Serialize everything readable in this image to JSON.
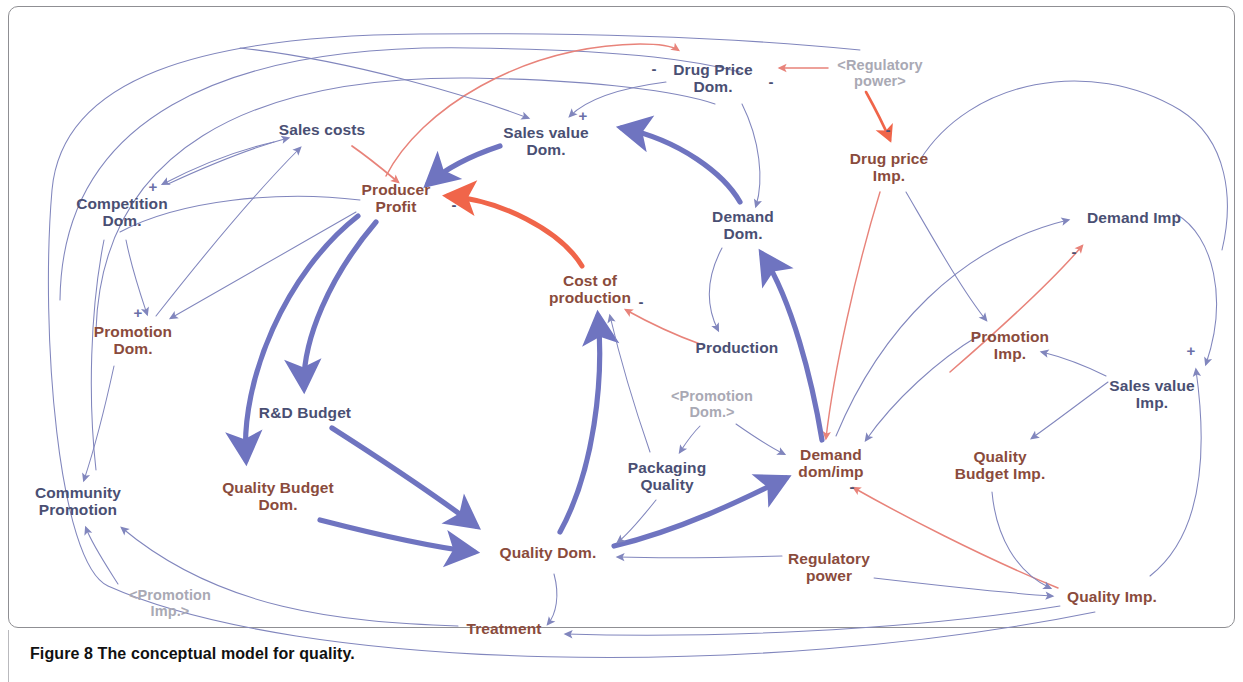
{
  "figure": {
    "caption_lead": "Figure 8",
    "caption_rest": " The conceptual model for quality.",
    "border_color": "#8f8f93"
  },
  "palette": {
    "node_blue": "#4a4f73",
    "node_brown": "#8a4b3c",
    "ghost_gray": "#a9a9b4",
    "link_thin_blue": "#8186bd",
    "link_thick_blue": "#6f74c0",
    "link_thin_red": "#e8837a",
    "link_thick_red": "#f0654a",
    "background": "#ffffff"
  },
  "nodes": [
    {
      "id": "competition-dom",
      "label": "Competition\nDom.",
      "color": "blue",
      "x": 122,
      "y": 212
    },
    {
      "id": "sales-costs",
      "label": "Sales costs",
      "color": "blue",
      "x": 322,
      "y": 130
    },
    {
      "id": "producer-profit",
      "label": "Producer\nProfit",
      "color": "brown",
      "x": 396,
      "y": 198
    },
    {
      "id": "sales-value-dom",
      "label": "Sales value\nDom.",
      "color": "blue",
      "x": 546,
      "y": 141
    },
    {
      "id": "drug-price-dom",
      "label": "Drug Price\nDom.",
      "color": "blue",
      "x": 713,
      "y": 78
    },
    {
      "id": "regulatory-power-ref",
      "label": "<Regulatory\npower>",
      "color": "ghost",
      "x": 880,
      "y": 73
    },
    {
      "id": "drug-price-imp",
      "label": "Drug price\nImp.",
      "color": "brown",
      "x": 889,
      "y": 167
    },
    {
      "id": "demand-dom",
      "label": "Demand\nDom.",
      "color": "blue",
      "x": 743,
      "y": 225
    },
    {
      "id": "cost-of-production",
      "label": "Cost of\nproduction",
      "color": "brown",
      "x": 590,
      "y": 289
    },
    {
      "id": "production",
      "label": "Production",
      "color": "blue",
      "x": 737,
      "y": 348
    },
    {
      "id": "demand-imp",
      "label": "Demand Imp",
      "color": "blue",
      "x": 1134,
      "y": 218
    },
    {
      "id": "promotion-imp",
      "label": "Promotion\nImp.",
      "color": "brown",
      "x": 1010,
      "y": 345
    },
    {
      "id": "sales-value-imp",
      "label": "Sales value\nImp.",
      "color": "blue",
      "x": 1152,
      "y": 394
    },
    {
      "id": "quality-budget-imp",
      "label": "Quality\nBudget Imp.",
      "color": "brown",
      "x": 1000,
      "y": 465
    },
    {
      "id": "promotion-dom",
      "label": "Promotion\nDom.",
      "color": "brown",
      "x": 133,
      "y": 340
    },
    {
      "id": "rd-budget",
      "label": "R&D Budget",
      "color": "blue",
      "x": 305,
      "y": 413
    },
    {
      "id": "quality-budget-dom",
      "label": "Quality Budget\nDom.",
      "color": "brown",
      "x": 278,
      "y": 496
    },
    {
      "id": "community-promotion",
      "label": "Community\nPromotion",
      "color": "blue",
      "x": 78,
      "y": 501
    },
    {
      "id": "promotion-imp-ref",
      "label": "<Promotion\nImp.>",
      "color": "ghost",
      "x": 170,
      "y": 603
    },
    {
      "id": "packaging-quality",
      "label": "Packaging\nQuality",
      "color": "blue",
      "x": 667,
      "y": 476
    },
    {
      "id": "promotion-dom-ref",
      "label": "<Promotion\nDom.>",
      "color": "ghost",
      "x": 712,
      "y": 404
    },
    {
      "id": "demand-dom-imp",
      "label": "Demand\ndom/imp",
      "color": "brown",
      "x": 831,
      "y": 463
    },
    {
      "id": "quality-dom",
      "label": "Quality Dom.",
      "color": "brown",
      "x": 548,
      "y": 553
    },
    {
      "id": "regulatory-power",
      "label": "Regulatory\npower",
      "color": "brown",
      "x": 829,
      "y": 567
    },
    {
      "id": "quality-imp",
      "label": "Quality Imp.",
      "color": "brown",
      "x": 1112,
      "y": 597
    },
    {
      "id": "treatment",
      "label": "Treatment",
      "color": "brown",
      "x": 504,
      "y": 629
    }
  ],
  "polarity_marks": [
    {
      "id": "pol-competition-salescosts",
      "sign": "+",
      "x": 153,
      "y": 186
    },
    {
      "id": "pol-competition-promotion",
      "sign": "+",
      "x": 138,
      "y": 312
    },
    {
      "id": "pol-salesvalue-dom",
      "sign": "+",
      "x": 583,
      "y": 115
    },
    {
      "id": "pol-drugprice-dom-left",
      "sign": "-",
      "x": 654,
      "y": 68
    },
    {
      "id": "pol-drugprice-dom-right",
      "sign": "-",
      "x": 771,
      "y": 81
    },
    {
      "id": "pol-producer-profit",
      "sign": "-",
      "x": 454,
      "y": 204
    },
    {
      "id": "pol-drugprice-imp",
      "sign": "-",
      "x": 888,
      "y": 129
    },
    {
      "id": "pol-cost-of-production",
      "sign": "-",
      "x": 641,
      "y": 301
    },
    {
      "id": "pol-demand-imp",
      "sign": "-",
      "x": 1074,
      "y": 251
    },
    {
      "id": "pol-demand-dom-imp",
      "sign": "-",
      "x": 852,
      "y": 486
    },
    {
      "id": "pol-sales-value-imp",
      "sign": "+",
      "x": 1191,
      "y": 350
    }
  ],
  "links": [
    {
      "id": "competition-to-salescosts",
      "from": "competition-dom",
      "to": "sales-costs",
      "style": "thin-blue",
      "sign": "+"
    },
    {
      "id": "salescosts-to-competition",
      "from": "sales-costs",
      "to": "competition-dom",
      "style": "thin-blue",
      "sign": ""
    },
    {
      "id": "salescosts-to-producerprofit",
      "from": "sales-costs",
      "to": "producer-profit",
      "style": "thin-red",
      "sign": "-"
    },
    {
      "id": "competition-to-promotion-dom",
      "from": "competition-dom",
      "to": "promotion-dom",
      "style": "thin-blue",
      "sign": "+"
    },
    {
      "id": "producerprofit-to-promotion-dom",
      "from": "producer-profit",
      "to": "promotion-dom",
      "style": "thin-blue",
      "sign": ""
    },
    {
      "id": "promotion-dom-to-salescosts",
      "from": "promotion-dom",
      "to": "sales-costs",
      "style": "thin-blue",
      "sign": ""
    },
    {
      "id": "salesvalue-to-producerprofit",
      "from": "sales-value-dom",
      "to": "producer-profit",
      "style": "thick-blue",
      "sign": "+"
    },
    {
      "id": "drugprice-dom-to-salesvalue",
      "from": "drug-price-dom",
      "to": "sales-value-dom",
      "style": "thin-blue",
      "sign": "+"
    },
    {
      "id": "producerprofit-to-drugprice-dom",
      "from": "producer-profit",
      "to": "drug-price-dom",
      "style": "thin-red",
      "sign": "-"
    },
    {
      "id": "regulatory-ref-to-drugprice-dom",
      "from": "regulatory-power-ref",
      "to": "drug-price-dom",
      "style": "thin-red",
      "sign": "-"
    },
    {
      "id": "regulatory-ref-to-drugprice-imp",
      "from": "regulatory-power-ref",
      "to": "drug-price-imp",
      "style": "thick-red",
      "sign": "-"
    },
    {
      "id": "drugprice-dom-to-demand-dom",
      "from": "drug-price-dom",
      "to": "demand-dom",
      "style": "thin-blue",
      "sign": ""
    },
    {
      "id": "demand-dom-to-salesvalue",
      "from": "demand-dom",
      "to": "sales-value-dom",
      "style": "thick-blue",
      "sign": "+"
    },
    {
      "id": "costofproduction-to-profit",
      "from": "cost-of-production",
      "to": "producer-profit",
      "style": "thick-red",
      "sign": "-"
    },
    {
      "id": "demand-dom-to-production",
      "from": "demand-dom",
      "to": "production",
      "style": "thin-blue",
      "sign": ""
    },
    {
      "id": "production-to-costofproduction",
      "from": "production",
      "to": "cost-of-production",
      "style": "thin-red",
      "sign": "-"
    },
    {
      "id": "quality-dom-to-costofproduction",
      "from": "quality-dom",
      "to": "cost-of-production",
      "style": "thick-blue",
      "sign": ""
    },
    {
      "id": "packaging-to-costofproduction",
      "from": "packaging-quality",
      "to": "cost-of-production",
      "style": "thin-blue",
      "sign": ""
    },
    {
      "id": "profit-to-rdbudget",
      "from": "producer-profit",
      "to": "rd-budget",
      "style": "thick-blue",
      "sign": ""
    },
    {
      "id": "profit-to-qualitybudget-dom",
      "from": "producer-profit",
      "to": "quality-budget-dom",
      "style": "thick-blue",
      "sign": ""
    },
    {
      "id": "rdbudget-to-quality-dom",
      "from": "rd-budget",
      "to": "quality-dom",
      "style": "thick-blue",
      "sign": ""
    },
    {
      "id": "qualitybudget-to-quality-dom",
      "from": "quality-budget-dom",
      "to": "quality-dom",
      "style": "thick-blue",
      "sign": ""
    },
    {
      "id": "quality-dom-to-demand-dom-imp",
      "from": "quality-dom",
      "to": "demand-dom-imp",
      "style": "thick-blue",
      "sign": ""
    },
    {
      "id": "promotion-dom-ref-to-packaging",
      "from": "promotion-dom-ref",
      "to": "packaging-quality",
      "style": "thin-blue",
      "sign": ""
    },
    {
      "id": "promotion-dom-ref-to-demand",
      "from": "promotion-dom-ref",
      "to": "demand-dom-imp",
      "style": "thin-blue",
      "sign": ""
    },
    {
      "id": "packaging-to-quality-dom",
      "from": "packaging-quality",
      "to": "quality-dom",
      "style": "thin-blue",
      "sign": ""
    },
    {
      "id": "regulatory-power-to-quality-dom",
      "from": "regulatory-power",
      "to": "quality-dom",
      "style": "thin-blue",
      "sign": ""
    },
    {
      "id": "quality-dom-to-treatment",
      "from": "quality-dom",
      "to": "treatment",
      "style": "thin-blue",
      "sign": ""
    },
    {
      "id": "quality-imp-to-treatment",
      "from": "quality-imp",
      "to": "treatment",
      "style": "thin-blue",
      "sign": ""
    },
    {
      "id": "treatment-to-community",
      "from": "treatment",
      "to": "community-promotion",
      "style": "thin-blue",
      "sign": ""
    },
    {
      "id": "promotion-imp-ref-to-community",
      "from": "promotion-imp-ref",
      "to": "community-promotion",
      "style": "thin-blue",
      "sign": ""
    },
    {
      "id": "promotion-dom-to-community",
      "from": "promotion-dom",
      "to": "community-promotion",
      "style": "thin-blue",
      "sign": ""
    },
    {
      "id": "quality-imp-to-community",
      "from": "quality-imp",
      "to": "community-promotion",
      "style": "thin-blue",
      "sign": ""
    },
    {
      "id": "drugprice-imp-to-demand-dom-imp",
      "from": "drug-price-imp",
      "to": "demand-dom-imp",
      "style": "thin-red",
      "sign": "-"
    },
    {
      "id": "drugprice-imp-to-promotion-imp",
      "from": "drug-price-imp",
      "to": "promotion-imp",
      "style": "thin-blue",
      "sign": ""
    },
    {
      "id": "demand-dom-imp-to-demand-imp",
      "from": "demand-dom-imp",
      "to": "demand-imp",
      "style": "thin-blue",
      "sign": ""
    },
    {
      "id": "quality-imp-to-demand-dom-imp",
      "from": "quality-imp",
      "to": "demand-dom-imp",
      "style": "thin-red",
      "sign": "-"
    },
    {
      "id": "regulatory-power-to-quality-imp",
      "from": "regulatory-power",
      "to": "quality-imp",
      "style": "thin-blue",
      "sign": ""
    },
    {
      "id": "qualitybudget-imp-to-quality-imp",
      "from": "quality-budget-imp",
      "to": "quality-imp",
      "style": "thin-blue",
      "sign": ""
    },
    {
      "id": "salesvalue-imp-to-promotion-imp",
      "from": "sales-value-imp",
      "to": "promotion-imp",
      "style": "thin-blue",
      "sign": ""
    },
    {
      "id": "salesvalue-imp-to-qualitybudget",
      "from": "sales-value-imp",
      "to": "quality-budget-imp",
      "style": "thin-blue",
      "sign": ""
    },
    {
      "id": "quality-imp-to-salesvalue-imp",
      "from": "quality-imp",
      "to": "sales-value-imp",
      "style": "thin-blue",
      "sign": "+"
    },
    {
      "id": "demand-imp-to-salesvalue-imp",
      "from": "demand-imp",
      "to": "sales-value-imp",
      "style": "thin-blue",
      "sign": "+"
    },
    {
      "id": "promotion-imp-to-demand-imp",
      "from": "promotion-imp",
      "to": "demand-imp",
      "style": "thin-blue",
      "sign": ""
    },
    {
      "id": "promotion-imp-to-demand-dom-imp",
      "from": "promotion-imp",
      "to": "demand-dom-imp",
      "style": "thin-blue",
      "sign": ""
    },
    {
      "id": "demand-dom-imp-to-demand-dom",
      "from": "demand-dom-imp",
      "to": "demand-dom",
      "style": "thick-blue",
      "sign": ""
    }
  ]
}
